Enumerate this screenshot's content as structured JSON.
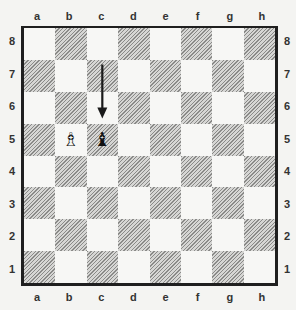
{
  "board": {
    "files": [
      "a",
      "b",
      "c",
      "d",
      "e",
      "f",
      "g",
      "h"
    ],
    "ranks": [
      "8",
      "7",
      "6",
      "5",
      "4",
      "3",
      "2",
      "1"
    ],
    "orientation": "white-bottom",
    "colors": {
      "light": "#f7f7f5",
      "dark_hatch": "#8a8a88",
      "border": "#1f1f1f"
    }
  },
  "pieces": [
    {
      "square": "b5",
      "color": "white",
      "type": "bishop",
      "glyph": "♗",
      "icon": "white-bishop-icon"
    },
    {
      "square": "c5",
      "color": "black",
      "type": "bishop",
      "glyph": "♝",
      "icon": "black-bishop-icon"
    }
  ],
  "arrows": [
    {
      "from": "c7",
      "to": "c6",
      "label": "arrow pointing down toward c5"
    }
  ]
}
